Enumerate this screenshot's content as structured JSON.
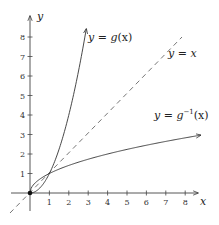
{
  "chart_data": {
    "type": "line",
    "title": "",
    "xlabel": "x",
    "ylabel": "y",
    "xlim": [
      -1,
      8.9
    ],
    "ylim": [
      -1,
      9.2
    ],
    "grid": false,
    "x_ticks": [
      1,
      2,
      3,
      4,
      5,
      6,
      7,
      8
    ],
    "y_ticks": [
      1,
      2,
      3,
      4,
      5,
      6,
      7,
      8
    ],
    "series": [
      {
        "name": "y = g(x)",
        "function": "x^2",
        "x_range": [
          0,
          2.9
        ],
        "style": "solid",
        "arrow_end": true,
        "x": [
          0,
          0.5,
          1,
          1.5,
          2,
          2.5,
          2.9
        ],
        "y": [
          0,
          0.25,
          1,
          2.25,
          4,
          6.25,
          8.41
        ]
      },
      {
        "name": "y = x",
        "function": "x",
        "x_range": [
          -1,
          7.9
        ],
        "style": "dashed",
        "x": [
          -1,
          0,
          1,
          4,
          7.9
        ],
        "y": [
          -1,
          0,
          1,
          4,
          7.9
        ]
      },
      {
        "name": "y = g^{-1}(x)",
        "function": "sqrt(x)",
        "x_range": [
          0,
          8.8
        ],
        "style": "solid",
        "arrow_end": true,
        "x": [
          0,
          0.25,
          1,
          2,
          4,
          6,
          8.8
        ],
        "y": [
          0,
          0.5,
          1,
          1.41,
          2,
          2.45,
          2.97
        ]
      }
    ],
    "annotations": [
      {
        "text": "y = g(x)",
        "near": [
          3,
          8
        ]
      },
      {
        "text": "y = x",
        "near": [
          7.2,
          7
        ]
      },
      {
        "text": "y = g^{-1}(x)",
        "near": [
          6.5,
          4
        ]
      }
    ],
    "points": [
      {
        "x": 0,
        "y": 0,
        "marker": "filled-dot"
      }
    ]
  },
  "labels": {
    "x_axis": "x",
    "y_axis": "y",
    "g": {
      "lhs": "y",
      "eq": " = ",
      "fn": "g",
      "arg": "(x)"
    },
    "identity": {
      "lhs": "y",
      "eq": " = ",
      "rhs": "x"
    },
    "ginv": {
      "lhs": "y",
      "eq": " = ",
      "fn": "g",
      "sup": "−1",
      "arg": "(x)"
    }
  },
  "ticks": {
    "x": [
      "1",
      "2",
      "3",
      "4",
      "5",
      "6",
      "7",
      "8"
    ],
    "y": [
      "1",
      "2",
      "3",
      "4",
      "5",
      "6",
      "7",
      "8"
    ]
  }
}
